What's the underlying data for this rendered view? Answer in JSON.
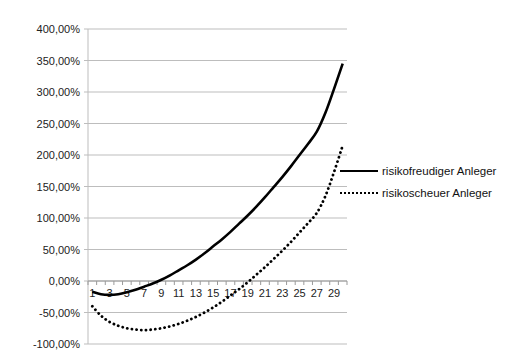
{
  "chart_data": {
    "type": "line",
    "title": "",
    "xlabel": "",
    "ylabel": "",
    "ylim": [
      -1.0,
      4.0
    ],
    "grid": true,
    "legend_position": "right",
    "y_ticks": [
      "400,00%",
      "350,00%",
      "300,00%",
      "250,00%",
      "200,00%",
      "150,00%",
      "100,00%",
      "50,00%",
      "0,00%",
      "-50,00%",
      "-100,00%"
    ],
    "x": [
      1,
      2,
      3,
      4,
      5,
      6,
      7,
      8,
      9,
      10,
      11,
      12,
      13,
      14,
      15,
      16,
      17,
      18,
      19,
      20,
      21,
      22,
      23,
      24,
      25,
      26,
      27,
      28,
      29,
      30
    ],
    "x_tick_labels": [
      "1",
      "3",
      "5",
      "7",
      "9",
      "11",
      "13",
      "15",
      "17",
      "19",
      "21",
      "23",
      "25",
      "27",
      "29"
    ],
    "series": [
      {
        "name": "risikofreudiger Anleger",
        "style": "solid",
        "values": [
          -0.17,
          -0.21,
          -0.22,
          -0.21,
          -0.18,
          -0.14,
          -0.09,
          -0.04,
          0.02,
          0.09,
          0.17,
          0.25,
          0.34,
          0.44,
          0.55,
          0.66,
          0.78,
          0.91,
          1.04,
          1.18,
          1.33,
          1.49,
          1.65,
          1.82,
          2.0,
          2.18,
          2.37,
          2.67,
          3.05,
          3.45
        ]
      },
      {
        "name": "risikoscheuer Anleger",
        "style": "dotted",
        "values": [
          -0.4,
          -0.55,
          -0.65,
          -0.71,
          -0.75,
          -0.77,
          -0.78,
          -0.77,
          -0.75,
          -0.72,
          -0.68,
          -0.63,
          -0.57,
          -0.5,
          -0.42,
          -0.33,
          -0.23,
          -0.13,
          -0.02,
          0.1,
          0.22,
          0.35,
          0.48,
          0.62,
          0.77,
          0.92,
          1.08,
          1.35,
          1.73,
          2.15
        ]
      }
    ]
  },
  "legend": {
    "items": [
      {
        "label": "risikofreudiger Anleger"
      },
      {
        "label": "risikoscheuer Anleger"
      }
    ]
  }
}
